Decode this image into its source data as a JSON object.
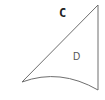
{
  "diagram": {
    "labels": {
      "c": "C",
      "d": "D"
    },
    "colors": {
      "stroke": "#6e6e6e",
      "label_c": "#222222",
      "label_d": "#555555",
      "background": "#ffffff"
    },
    "vertices": {
      "top": [
        98,
        5
      ],
      "left": [
        22,
        82
      ],
      "bottom_right": [
        98,
        90
      ]
    }
  }
}
